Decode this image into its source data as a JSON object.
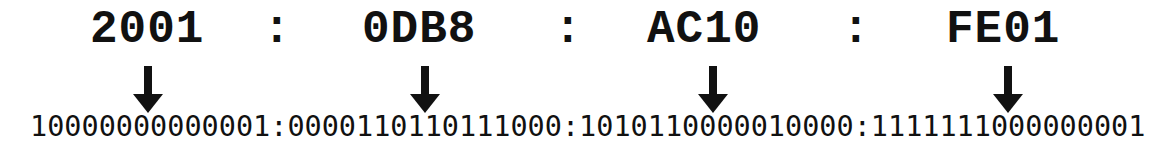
{
  "ipv6": {
    "groups": [
      {
        "hex": "2001",
        "binary": "10000000000001"
      },
      {
        "hex": "0DB8",
        "binary": "0000110110111000"
      },
      {
        "hex": "AC10",
        "binary": "1010110000010000"
      },
      {
        "hex": "FE01",
        "binary": "1111111000000001"
      }
    ],
    "separator": ":",
    "binary_full": "10000000000001:0000110110111000:1010110000010000:1111111000000001"
  },
  "icons": {
    "arrow": "arrow-down-icon"
  },
  "colors": {
    "text": "#111111",
    "background": "#ffffff"
  }
}
